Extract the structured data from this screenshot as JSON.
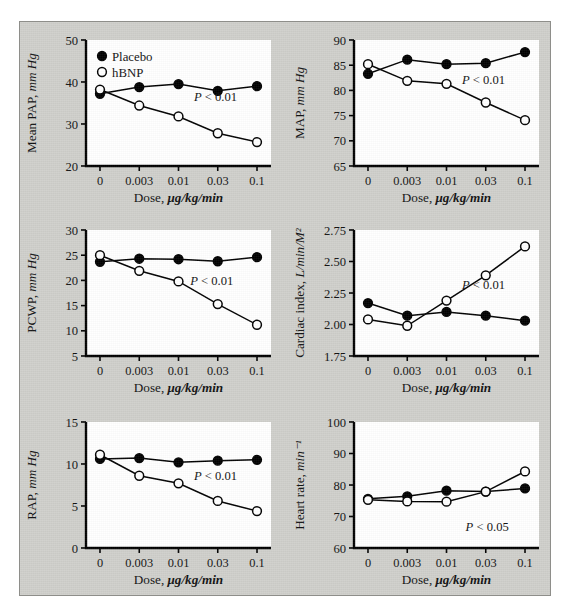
{
  "figure": {
    "background_color": "#cfcfcb",
    "plot_background_color": "#ffffff",
    "axis_color": "#000000",
    "legend": {
      "placebo_label": "Placebo",
      "hbnp_label": "hBNP",
      "placebo_marker": "filled-circle",
      "hbnp_marker": "open-circle"
    },
    "shared_x": {
      "label": "Dose, ",
      "label_units": "μg/kg/min",
      "tick_labels": [
        "0",
        "0.003",
        "0.01",
        "0.03",
        "0.1"
      ]
    }
  },
  "chart_data": [
    {
      "type": "line",
      "panel_id": "mean-pap",
      "title": "",
      "xlabel": "Dose, μg/kg/min",
      "ylabel": "Mean PAP, ",
      "ylabel_units": "mm Hg",
      "x": [
        "0",
        "0.003",
        "0.01",
        "0.03",
        "0.1"
      ],
      "xtick_labels": [
        "0",
        "0.003",
        "0.01",
        "0.03",
        "0.1"
      ],
      "ylim": [
        20,
        50
      ],
      "ytick_labels": [
        "20",
        "30",
        "40",
        "50"
      ],
      "yticks": [
        20,
        30,
        40,
        50
      ],
      "grid": false,
      "annotation": "P < 0.01",
      "annotation_x_frac": 0.7,
      "annotation_y_value": 35.4,
      "series": [
        {
          "name": "Placebo",
          "marker": "filled-circle",
          "values": [
            37.2,
            38.8,
            39.5,
            37.9,
            39.0
          ]
        },
        {
          "name": "hBNP",
          "marker": "open-circle",
          "values": [
            38.2,
            34.4,
            31.8,
            27.8,
            25.7
          ]
        }
      ]
    },
    {
      "type": "line",
      "panel_id": "map",
      "title": "",
      "xlabel": "Dose, μg/kg/min",
      "ylabel": "MAP, ",
      "ylabel_units": "mm Hg",
      "x": [
        "0",
        "0.003",
        "0.01",
        "0.03",
        "0.1"
      ],
      "xtick_labels": [
        "0",
        "0.003",
        "0.01",
        "0.03",
        "0.1"
      ],
      "ylim": [
        65,
        90
      ],
      "ytick_labels": [
        "65",
        "70",
        "75",
        "80",
        "85",
        "90"
      ],
      "yticks": [
        65,
        70,
        75,
        80,
        85,
        90
      ],
      "grid": false,
      "annotation": "P < 0.01",
      "annotation_x_frac": 0.7,
      "annotation_y_value": 81.2,
      "series": [
        {
          "name": "Placebo",
          "marker": "filled-circle",
          "values": [
            83.3,
            86.1,
            85.2,
            85.4,
            87.6
          ]
        },
        {
          "name": "hBNP",
          "marker": "open-circle",
          "values": [
            85.2,
            81.9,
            81.3,
            77.6,
            74.1
          ]
        }
      ]
    },
    {
      "type": "line",
      "panel_id": "pcwp",
      "title": "",
      "xlabel": "Dose, μg/kg/min",
      "ylabel": "PCWP, ",
      "ylabel_units": "mm Hg",
      "x": [
        "0",
        "0.003",
        "0.01",
        "0.03",
        "0.1"
      ],
      "xtick_labels": [
        "0",
        "0.003",
        "0.01",
        "0.03",
        "0.1"
      ],
      "ylim": [
        5,
        30
      ],
      "ytick_labels": [
        "5",
        "10",
        "15",
        "20",
        "25",
        "30"
      ],
      "yticks": [
        5,
        10,
        15,
        20,
        25,
        30
      ],
      "grid": false,
      "annotation": "P < 0.01",
      "annotation_x_frac": 0.68,
      "annotation_y_value": 19.0,
      "series": [
        {
          "name": "Placebo",
          "marker": "filled-circle",
          "values": [
            23.7,
            24.3,
            24.2,
            23.8,
            24.6
          ]
        },
        {
          "name": "hBNP",
          "marker": "open-circle",
          "values": [
            25.0,
            21.9,
            19.8,
            15.3,
            11.2
          ]
        }
      ]
    },
    {
      "type": "line",
      "panel_id": "cardiac-index",
      "title": "",
      "xlabel": "Dose, μg/kg/min",
      "ylabel": "Cardiac index, ",
      "ylabel_units": "L/min/M²",
      "x": [
        "0",
        "0.003",
        "0.01",
        "0.03",
        "0.1"
      ],
      "xtick_labels": [
        "0",
        "0.003",
        "0.01",
        "0.03",
        "0.1"
      ],
      "ylim": [
        1.75,
        2.75
      ],
      "ytick_labels": [
        "1.75",
        "2.00",
        "2.25",
        "2.50",
        "2.75"
      ],
      "yticks": [
        1.75,
        2.0,
        2.25,
        2.5,
        2.75
      ],
      "grid": false,
      "annotation": "P < 0.01",
      "annotation_x_frac": 0.7,
      "annotation_y_value": 2.28,
      "series": [
        {
          "name": "Placebo",
          "marker": "filled-circle",
          "values": [
            2.17,
            2.07,
            2.1,
            2.07,
            2.03
          ]
        },
        {
          "name": "hBNP",
          "marker": "open-circle",
          "values": [
            2.04,
            1.99,
            2.19,
            2.39,
            2.62
          ]
        }
      ]
    },
    {
      "type": "line",
      "panel_id": "rap",
      "title": "",
      "xlabel": "Dose, μg/kg/min",
      "ylabel": "RAP, ",
      "ylabel_units": "mm Hg",
      "x": [
        "0",
        "0.003",
        "0.01",
        "0.03",
        "0.1"
      ],
      "xtick_labels": [
        "0",
        "0.003",
        "0.01",
        "0.03",
        "0.1"
      ],
      "ylim": [
        0,
        15
      ],
      "ytick_labels": [
        "0",
        "5",
        "10",
        "15"
      ],
      "yticks": [
        0,
        5,
        10,
        15
      ],
      "grid": false,
      "annotation": "P < 0.01",
      "annotation_x_frac": 0.7,
      "annotation_y_value": 8.1,
      "series": [
        {
          "name": "Placebo",
          "marker": "filled-circle",
          "values": [
            10.6,
            10.7,
            10.2,
            10.4,
            10.5
          ]
        },
        {
          "name": "hBNP",
          "marker": "open-circle",
          "values": [
            11.1,
            8.6,
            7.7,
            5.6,
            4.4
          ]
        }
      ]
    },
    {
      "type": "line",
      "panel_id": "heart-rate",
      "title": "",
      "xlabel": "Dose, μg/kg/min",
      "ylabel": "Heart rate, ",
      "ylabel_units": "min⁻¹",
      "x": [
        "0",
        "0.003",
        "0.01",
        "0.03",
        "0.1"
      ],
      "xtick_labels": [
        "0",
        "0.003",
        "0.01",
        "0.03",
        "0.1"
      ],
      "ylim": [
        60,
        100
      ],
      "ytick_labels": [
        "60",
        "70",
        "80",
        "90",
        "100"
      ],
      "yticks": [
        60,
        70,
        80,
        90,
        100
      ],
      "grid": false,
      "annotation": "P < 0.05",
      "annotation_x_frac": 0.72,
      "annotation_y_value": 65.5,
      "series": [
        {
          "name": "Placebo",
          "marker": "filled-circle",
          "values": [
            75.6,
            76.4,
            78.2,
            77.9,
            78.9
          ]
        },
        {
          "name": "hBNP",
          "marker": "open-circle",
          "values": [
            75.3,
            74.8,
            74.7,
            77.9,
            84.3
          ]
        }
      ]
    }
  ]
}
